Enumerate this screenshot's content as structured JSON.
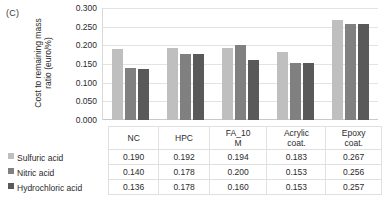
{
  "panel": {
    "label": "(C)"
  },
  "chart_data": {
    "type": "bar",
    "title": "",
    "xlabel": "",
    "ylabel": "Cost to remaining mass\nratio (euro/%)",
    "ylim": [
      0.0,
      0.3
    ],
    "ytick_labels": [
      "0.300",
      "0.250",
      "0.200",
      "0.150",
      "0.100",
      "0.050",
      "0.000"
    ],
    "ytick_values": [
      0.3,
      0.25,
      0.2,
      0.15,
      0.1,
      0.05,
      0.0
    ],
    "grid": true,
    "legend_position": "table-left",
    "categories": [
      "NC",
      "HPC",
      "FA_10 M",
      "Acrylic coat.",
      "Epoxy coat."
    ],
    "category_lines": [
      [
        "NC",
        ""
      ],
      [
        "HPC",
        ""
      ],
      [
        "FA_10",
        "M"
      ],
      [
        "Acrylic",
        "coat."
      ],
      [
        "Epoxy",
        "coat."
      ]
    ],
    "series": [
      {
        "name": "Sulfuric acid",
        "color": "#bfbfbf",
        "values": [
          0.19,
          0.192,
          0.194,
          0.183,
          0.267
        ],
        "value_labels": [
          "0.190",
          "0.192",
          "0.194",
          "0.183",
          "0.267"
        ]
      },
      {
        "name": "Nitric acid",
        "color": "#808080",
        "values": [
          0.14,
          0.178,
          0.2,
          0.153,
          0.256
        ],
        "value_labels": [
          "0.140",
          "0.178",
          "0.200",
          "0.153",
          "0.256"
        ]
      },
      {
        "name": "Hydrochloric acid",
        "color": "#595959",
        "values": [
          0.136,
          0.178,
          0.16,
          0.153,
          0.257
        ],
        "value_labels": [
          "0.136",
          "0.178",
          "0.160",
          "0.153",
          "0.257"
        ]
      }
    ]
  }
}
